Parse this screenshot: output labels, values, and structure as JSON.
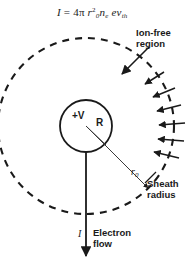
{
  "figure": {
    "equation": {
      "lhs": "I",
      "eq": "=",
      "coefficient": "4",
      "pi": "π",
      "radius_symbol": "r",
      "radius_subscript": "0",
      "radius_exponent": "2",
      "density_symbol": "n",
      "density_subscript": "e",
      "charge_symbol": "e",
      "velocity_symbol": "v",
      "velocity_subscript": "th",
      "plain": "I = 4π r₀² nₑ e vₜₕ"
    },
    "labels": {
      "ion_free_line1": "Ion-free",
      "ion_free_line2": "region",
      "sheath_line1": "Sheath",
      "sheath_line2": "radius",
      "electron_line1": "Electron",
      "electron_line2": "flow",
      "probe_potential": "+V",
      "probe_radius": "R",
      "sheath_radius_symbol": "r",
      "sheath_radius_subscript": "0",
      "current_symbol": "I"
    },
    "geometry": {
      "center_x": 86,
      "center_y": 126,
      "probe_radius_px": 26,
      "sheath_radius_px": 88,
      "sheath_dash_pattern": "7 6",
      "flux_arrow_count": 6
    },
    "colors": {
      "ink": "#1a1a1a",
      "background": "#ffffff",
      "line": "#262626",
      "thin_line": "#3a3a3a"
    }
  }
}
